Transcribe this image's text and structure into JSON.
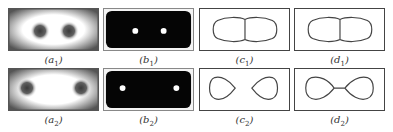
{
  "figure": {
    "rows": [
      {
        "panels": [
          {
            "id": "a1",
            "letter": "a",
            "index": "1",
            "kind": "grayscale-field",
            "description": "blurred field with two dark blobs close together"
          },
          {
            "id": "b1",
            "letter": "b",
            "index": "1",
            "kind": "binary-mask",
            "description": "black rounded rectangle with two white dots close together"
          },
          {
            "id": "c1",
            "letter": "c",
            "index": "1",
            "kind": "contour",
            "description": "two merged lobes sharing a vertical boundary"
          },
          {
            "id": "d1",
            "letter": "d",
            "index": "1",
            "kind": "contour",
            "description": "two merged lobes sharing a vertical boundary"
          }
        ]
      },
      {
        "panels": [
          {
            "id": "a2",
            "letter": "a",
            "index": "2",
            "kind": "grayscale-field",
            "description": "blurred field with two dark blobs far apart"
          },
          {
            "id": "b2",
            "letter": "b",
            "index": "2",
            "kind": "binary-mask",
            "description": "black rounded rectangle with two white dots far apart"
          },
          {
            "id": "c2",
            "letter": "c",
            "index": "2",
            "kind": "contour",
            "description": "two separate teardrop lobes"
          },
          {
            "id": "d2",
            "letter": "d",
            "index": "2",
            "kind": "contour",
            "description": "two teardrop lobes connected by a thin bridge"
          }
        ]
      }
    ],
    "colors": {
      "stroke": "#444444",
      "mask_fill": "#050505",
      "dot_fill": "#ffffff",
      "blob_dark": "#3a3a3a",
      "field_light": "#ffffff",
      "field_edge": "#555555"
    }
  }
}
